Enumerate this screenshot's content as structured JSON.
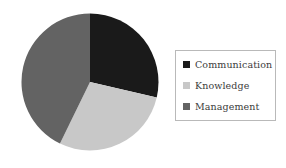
{
  "chart_data": {
    "type": "pie",
    "title": "",
    "subtitle": "",
    "xlabel": "",
    "ylabel": "",
    "grid": false,
    "legend_position": "right",
    "start_angle_deg": 0,
    "direction": "clockwise",
    "categories": [
      "Communication",
      "Knowledge",
      "Management"
    ],
    "values": [
      28.6,
      28.6,
      42.8
    ],
    "units": "percent",
    "slices": [
      {
        "label": "Communication",
        "value": 28.6,
        "angle_deg": 103,
        "color": "#1a1a1a",
        "swatch_color": "#1a1a1a"
      },
      {
        "label": "Knowledge",
        "value": 28.6,
        "angle_deg": 103,
        "color": "#c8c8c8",
        "swatch_color": "#c8c8c8"
      },
      {
        "label": "Management",
        "value": 42.8,
        "angle_deg": 154,
        "color": "#636363",
        "swatch_color": "#636363"
      }
    ]
  },
  "legend": {
    "items": [
      {
        "label": "Communication",
        "color": "#1a1a1a"
      },
      {
        "label": "Knowledge",
        "color": "#c8c8c8"
      },
      {
        "label": "Management",
        "color": "#636363"
      }
    ],
    "border_color": "#b9b9b9",
    "background": "#ffffff"
  },
  "colors": {
    "background": "#ffffff",
    "text": "#3b3b3b",
    "communication": "#1a1a1a",
    "knowledge": "#c8c8c8",
    "management": "#636363"
  }
}
